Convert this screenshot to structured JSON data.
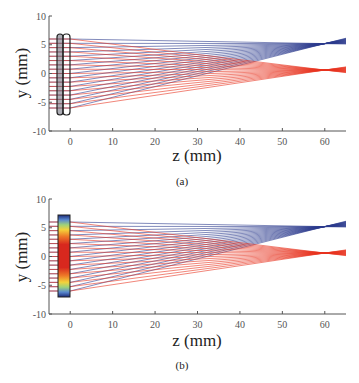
{
  "chart_data": [
    {
      "type": "line",
      "panel": "a",
      "caption": "(a)",
      "title": "",
      "xlabel": "z (mm)",
      "ylabel": "y (mm)",
      "xlim": [
        -5,
        65
      ],
      "ylim": [
        -10,
        10
      ],
      "xticks": [
        0,
        10,
        20,
        30,
        40,
        50,
        60
      ],
      "yticks": [
        -10,
        -5,
        0,
        5,
        10
      ],
      "grid": false,
      "element": {
        "kind": "doublet-lens-outline",
        "z_range": [
          -3,
          0
        ],
        "y_range": [
          -7,
          7
        ]
      },
      "series": [
        {
          "name": "blue rays",
          "color": "#2b3a8c",
          "input_y_range": [
            -6,
            6
          ],
          "focus_z": 60,
          "focus_y": 5.2,
          "end_y_range": [
            4.2,
            6.5
          ]
        },
        {
          "name": "red rays",
          "color": "#e8321e",
          "input_y_range": [
            -6,
            6
          ],
          "focus_z": 60,
          "focus_y": 0.6,
          "end_y_range": [
            -0.3,
            1.5
          ]
        }
      ]
    },
    {
      "type": "line",
      "panel": "b",
      "caption": "(b)",
      "title": "",
      "xlabel": "z (mm)",
      "ylabel": "y (mm)",
      "xlim": [
        -5,
        65
      ],
      "ylim": [
        -10,
        10
      ],
      "xticks": [
        0,
        10,
        20,
        30,
        40,
        50,
        60
      ],
      "yticks": [
        -10,
        -5,
        0,
        5,
        10
      ],
      "grid": false,
      "element": {
        "kind": "colormap-element (jet: red center, yellow/green, blue edges)",
        "z_range": [
          -3,
          0
        ],
        "y_range": [
          -7,
          7
        ]
      },
      "series": [
        {
          "name": "blue rays",
          "color": "#2b3a8c",
          "input_y_range": [
            -6,
            6
          ],
          "focus_z": 60,
          "focus_y": 5.2,
          "end_y_range": [
            4.2,
            6.5
          ]
        },
        {
          "name": "red rays",
          "color": "#e8321e",
          "input_y_range": [
            -6,
            6
          ],
          "focus_z": 60,
          "focus_y": 0.6,
          "end_y_range": [
            -0.3,
            1.5
          ]
        }
      ]
    }
  ],
  "panels": {
    "a": {
      "caption": "(a)",
      "xlabel": "z (mm)",
      "ylabel": "y (mm)"
    },
    "b": {
      "caption": "(b)",
      "xlabel": "z (mm)",
      "ylabel": "y (mm)"
    }
  },
  "ticks": {
    "x": [
      "0",
      "10",
      "20",
      "30",
      "40",
      "50",
      "60"
    ],
    "y": [
      "10",
      "5",
      "0",
      "-5",
      "-10"
    ]
  },
  "colors": {
    "blue": "#2b3a8c",
    "red": "#e8321e",
    "axis": "#555555"
  }
}
